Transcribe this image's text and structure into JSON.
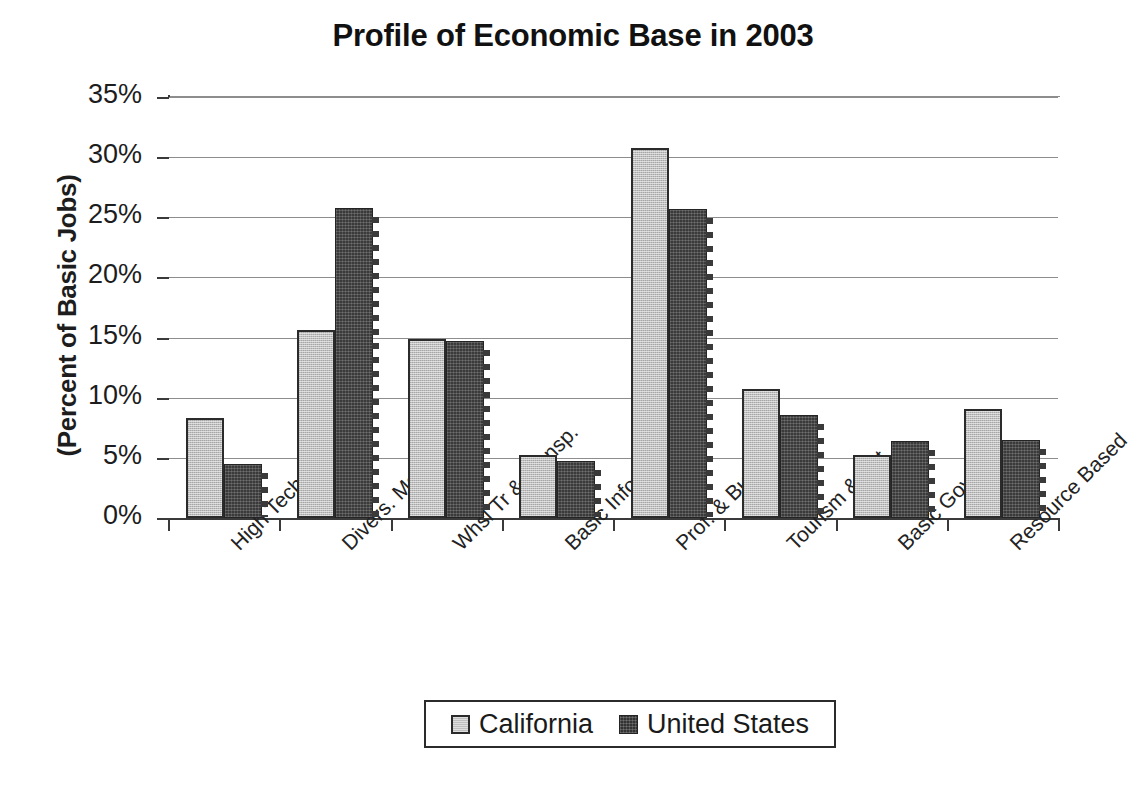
{
  "chart_data": {
    "type": "bar",
    "title": "Profile of Economic Base in 2003",
    "xlabel": "",
    "ylabel": "(Percent of Basic Jobs)",
    "ylim": [
      0,
      35
    ],
    "ytick_labels": [
      "0%",
      "5%",
      "10%",
      "15%",
      "20%",
      "25%",
      "30%",
      "35%"
    ],
    "ytick_values": [
      0,
      5,
      10,
      15,
      20,
      25,
      30,
      35
    ],
    "grid": true,
    "legend_position": "bottom",
    "categories": [
      "High Tech",
      "Divers. Manuf.",
      "Whsl Tr & Transp.",
      "Basic Info.",
      "Prof. & Bus. Serv.",
      "Tourism & Ent",
      "Basic Govt.",
      "Resource Based"
    ],
    "series": [
      {
        "name": "California",
        "color": "#bfbfbf",
        "values": [
          8.3,
          15.6,
          14.9,
          5.2,
          30.8,
          10.7,
          5.2,
          9.1
        ]
      },
      {
        "name": "United States",
        "color": "#3a3a3a",
        "values": [
          4.5,
          25.8,
          14.7,
          4.7,
          25.7,
          8.6,
          6.4,
          6.5
        ]
      }
    ]
  },
  "legend": {
    "items": [
      {
        "label": "California",
        "swatch": "ca"
      },
      {
        "label": "United States",
        "swatch": "us"
      }
    ]
  }
}
